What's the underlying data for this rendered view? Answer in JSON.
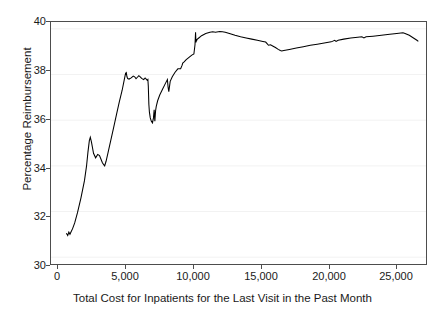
{
  "chart_data": {
    "type": "line",
    "title": "",
    "subtitle": "",
    "xlabel": "Total Cost for Inpatients for the Last Visit in the Past Month",
    "ylabel": "Percentage Reimbursement",
    "xlim": [
      -500,
      26400
    ],
    "ylim": [
      29.7,
      40.3
    ],
    "xticks": [
      0,
      5000,
      10000,
      15000,
      20000,
      25000
    ],
    "xticklabels": [
      "0",
      "5,000",
      "10,000",
      "15,000",
      "20,000",
      "25,000"
    ],
    "yticks": [
      30,
      32,
      34,
      36,
      38,
      40
    ],
    "yticklabels": [
      "30",
      "32",
      "34",
      "36",
      "38",
      "40"
    ],
    "grid": "horizontal-faint",
    "legend": null,
    "line_color": "#000000",
    "frame_color": "#4d4d4d",
    "background_color": "#ffffff",
    "series": [
      {
        "name": "Percentage Reimbursement",
        "x": [
          600,
          700,
          780,
          860,
          950,
          1050,
          1200,
          1400,
          1650,
          1900,
          2050,
          2150,
          2250,
          2320,
          2400,
          2550,
          2700,
          2850,
          2980,
          3080,
          3180,
          3280,
          3350,
          3450,
          3600,
          3800,
          4000,
          4200,
          4400,
          4600,
          4750,
          4850,
          4900,
          4950,
          5000,
          5100,
          5250,
          5400,
          5500,
          5600,
          5700,
          5800,
          5900,
          6000,
          6080,
          6150,
          6250,
          6330,
          6400,
          6450,
          6480,
          6500,
          6520,
          6560,
          6620,
          6700,
          6780,
          6850,
          6900,
          6950,
          7000,
          7050,
          7150,
          7300,
          7500,
          7700,
          7850,
          7900,
          7950,
          8050,
          8200,
          8400,
          8600,
          8800,
          8900,
          8950,
          9050,
          9200,
          9400,
          9600,
          9750,
          9830,
          9870,
          9900,
          9930,
          9960,
          10000,
          10100,
          10300,
          10600,
          10900,
          11100,
          11300,
          11600,
          11800,
          12000,
          12300,
          12700,
          13100,
          13500,
          13900,
          14300,
          14700,
          14900,
          15000,
          15100,
          15250,
          15400,
          15600,
          15800,
          15950,
          16050,
          16200,
          16600,
          17100,
          17600,
          18100,
          18600,
          19100,
          19600,
          19850,
          19950,
          20100,
          20500,
          21000,
          21500,
          21800,
          21950,
          22100,
          22600,
          23200,
          23800,
          24300,
          24600,
          24750,
          24900,
          25200,
          25500,
          25750,
          25850
        ],
        "y": [
          31.05,
          30.95,
          31.1,
          31.0,
          31.12,
          31.25,
          31.5,
          31.95,
          32.6,
          33.35,
          34.0,
          34.6,
          35.1,
          35.25,
          35.05,
          34.55,
          34.35,
          34.5,
          34.45,
          34.3,
          34.15,
          34.05,
          34.0,
          34.2,
          34.6,
          35.15,
          35.7,
          36.25,
          36.8,
          37.3,
          37.75,
          38.05,
          38.08,
          37.9,
          37.82,
          37.8,
          37.85,
          37.93,
          37.9,
          37.82,
          37.88,
          37.95,
          37.9,
          37.83,
          37.8,
          37.78,
          37.85,
          37.8,
          37.75,
          37.78,
          37.5,
          37.1,
          36.7,
          36.35,
          36.1,
          35.95,
          35.88,
          36.1,
          36.45,
          35.95,
          36.4,
          36.6,
          36.85,
          37.1,
          37.35,
          37.6,
          37.78,
          37.45,
          37.25,
          37.7,
          37.9,
          38.1,
          38.25,
          38.25,
          38.4,
          38.5,
          38.55,
          38.65,
          38.75,
          38.85,
          38.9,
          39.3,
          39.85,
          39.4,
          39.55,
          39.5,
          39.55,
          39.6,
          39.7,
          39.8,
          39.85,
          39.87,
          39.85,
          39.88,
          39.87,
          39.85,
          39.8,
          39.72,
          39.65,
          39.6,
          39.55,
          39.5,
          39.45,
          39.42,
          39.35,
          39.28,
          39.3,
          39.25,
          39.18,
          39.1,
          39.05,
          39.03,
          39.05,
          39.1,
          39.16,
          39.22,
          39.28,
          39.33,
          39.38,
          39.43,
          39.5,
          39.45,
          39.5,
          39.55,
          39.6,
          39.63,
          39.65,
          39.6,
          39.65,
          39.68,
          39.72,
          39.76,
          39.8,
          39.82,
          39.83,
          39.8,
          39.72,
          39.6,
          39.5,
          39.45
        ]
      }
    ]
  }
}
